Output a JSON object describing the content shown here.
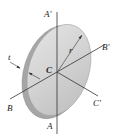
{
  "diagram": {
    "labels": {
      "a_prime": "A′",
      "a": "A",
      "b_prime": "B′",
      "b": "B",
      "c_prime": "C′",
      "c": "C",
      "radius": "r",
      "thickness": "t"
    },
    "colors": {
      "disk_face": "#cfcfcf",
      "disk_face_highlight": "#e2e2e2",
      "disk_edge": "#a8a8a8",
      "axis_line": "#333333",
      "label_text": "#222222"
    }
  }
}
